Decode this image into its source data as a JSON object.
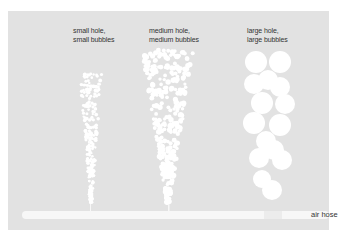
{
  "diagram": {
    "columns": [
      {
        "label_line1": "small hole,",
        "label_line2": "small bubbles",
        "label_x": 73,
        "label_y": 28
      },
      {
        "label_line1": "medium hole,",
        "label_line2": "medium bubbles",
        "label_x": 149,
        "label_y": 28
      },
      {
        "label_line1": "large hole,",
        "label_line2": "large bubbles",
        "label_x": 247,
        "label_y": 28
      }
    ],
    "hose_label": "air hose",
    "colors": {
      "background": "#e2e2e2",
      "bubble": "#ffffff",
      "hose": "#f7f7f7",
      "text": "#333333"
    }
  }
}
